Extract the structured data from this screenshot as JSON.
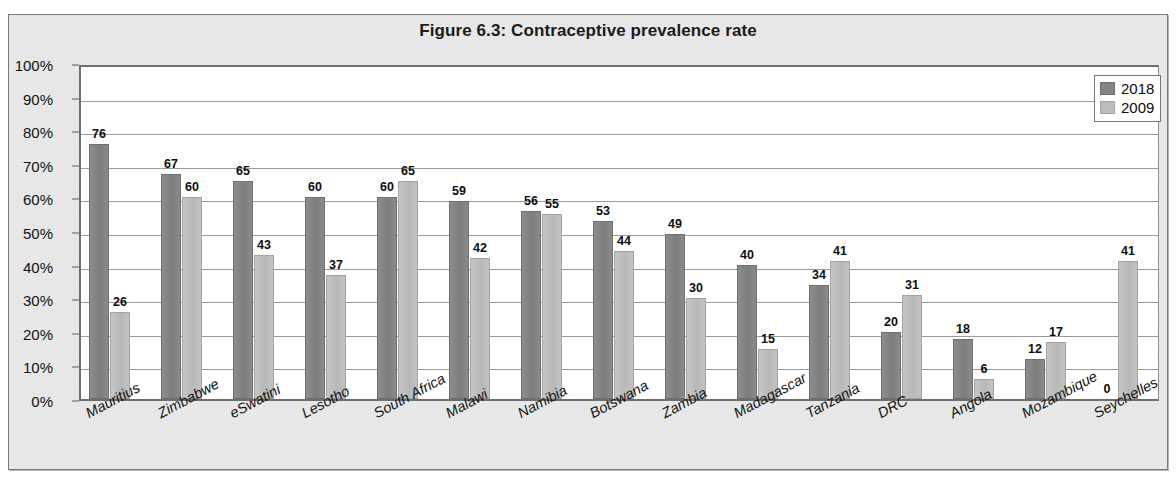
{
  "chart_data": {
    "type": "bar",
    "title": "Figure 6.3: Contraceptive prevalence rate",
    "xlabel": "",
    "ylabel": "",
    "ylim": [
      0,
      100
    ],
    "ytick_labels": [
      "100%",
      "90%",
      "80%",
      "70%",
      "60%",
      "50%",
      "40%",
      "30%",
      "20%",
      "10%",
      "0%"
    ],
    "ytick_values": [
      100,
      90,
      80,
      70,
      60,
      50,
      40,
      30,
      20,
      10,
      0
    ],
    "grid": true,
    "legend_position": "top-right",
    "categories": [
      "Mauritius",
      "Zimbabwe",
      "eSwatini",
      "Lesotho",
      "South Africa",
      "Malawi",
      "Namibia",
      "Botswana",
      "Zambia",
      "Madagascar",
      "Tanzania",
      "DRC",
      "Angola",
      "Mozambique",
      "Seychelles"
    ],
    "series": [
      {
        "name": "2018",
        "color": "#848484",
        "values": [
          76,
          67,
          65,
          60,
          60,
          59,
          56,
          53,
          49,
          40,
          34,
          20,
          18,
          12,
          0
        ]
      },
      {
        "name": "2009",
        "color": "#bdbdbd",
        "values": [
          26,
          60,
          43,
          37,
          65,
          42,
          55,
          44,
          30,
          15,
          41,
          31,
          6,
          17,
          41
        ]
      }
    ]
  },
  "legend": {
    "items": [
      {
        "label": "2018"
      },
      {
        "label": "2009"
      }
    ]
  }
}
